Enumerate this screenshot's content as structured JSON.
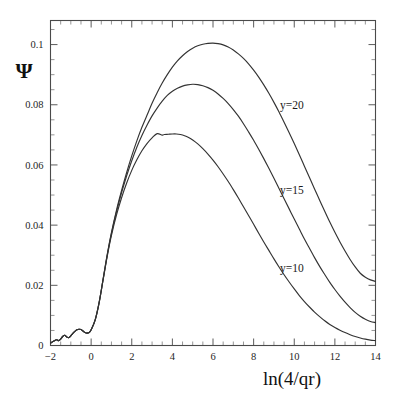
{
  "figure": {
    "background_color": "#ffffff",
    "line_color": "#333333",
    "axis_color": "#4a4a4a"
  },
  "chart_data": {
    "type": "line",
    "title": "",
    "subtitle": "",
    "xlabel": "ln(4/qr)",
    "ylabel": "Ψ",
    "xlim": [
      -2,
      14
    ],
    "ylim": [
      0,
      0.108
    ],
    "grid": false,
    "legend_position": "inline-annotations",
    "x_ticks": [
      -2,
      0,
      2,
      4,
      6,
      8,
      10,
      12,
      14
    ],
    "x_tick_labels": [
      "−2",
      "0",
      "2",
      "4",
      "6",
      "8",
      "10",
      "12",
      "14"
    ],
    "x_minor_tick_step": 0.5,
    "y_ticks": [
      0,
      0.02,
      0.04,
      0.06,
      0.08,
      0.1
    ],
    "y_tick_labels": [
      "0",
      "0.02",
      "0.04",
      "0.06",
      "0.08",
      "0.1"
    ],
    "y_minor_tick_step": 0.005,
    "annotations": [
      {
        "text": "y=20",
        "x": 9.3,
        "y": 0.0785
      },
      {
        "text": "y=15",
        "x": 9.3,
        "y": 0.0505
      },
      {
        "text": "y=10",
        "x": 9.3,
        "y": 0.0245
      }
    ],
    "series": [
      {
        "name": "y=20",
        "label": "y=20",
        "peak_x": 6.0,
        "peak_y": 0.1005,
        "points": [
          [
            -2.0,
            0.0008
          ],
          [
            -1.85,
            0.0014
          ],
          [
            -1.7,
            0.0019
          ],
          [
            -1.6,
            0.0016
          ],
          [
            -1.5,
            0.0021
          ],
          [
            -1.4,
            0.003
          ],
          [
            -1.3,
            0.0034
          ],
          [
            -1.2,
            0.0028
          ],
          [
            -1.1,
            0.0026
          ],
          [
            -1.0,
            0.0032
          ],
          [
            -0.9,
            0.004
          ],
          [
            -0.8,
            0.0047
          ],
          [
            -0.7,
            0.0052
          ],
          [
            -0.6,
            0.0054
          ],
          [
            -0.5,
            0.0053
          ],
          [
            -0.4,
            0.0048
          ],
          [
            -0.3,
            0.0043
          ],
          [
            -0.2,
            0.0041
          ],
          [
            -0.1,
            0.0043
          ],
          [
            0.0,
            0.0052
          ],
          [
            0.2,
            0.0085
          ],
          [
            0.4,
            0.0145
          ],
          [
            0.6,
            0.0225
          ],
          [
            0.8,
            0.0305
          ],
          [
            1.0,
            0.0375
          ],
          [
            1.25,
            0.045
          ],
          [
            1.5,
            0.0515
          ],
          [
            1.75,
            0.0575
          ],
          [
            2.0,
            0.063
          ],
          [
            2.25,
            0.068
          ],
          [
            2.5,
            0.0725
          ],
          [
            2.75,
            0.0765
          ],
          [
            3.0,
            0.0805
          ],
          [
            3.25,
            0.084
          ],
          [
            3.5,
            0.0872
          ],
          [
            3.75,
            0.09
          ],
          [
            4.0,
            0.0925
          ],
          [
            4.25,
            0.0946
          ],
          [
            4.5,
            0.0963
          ],
          [
            4.75,
            0.0977
          ],
          [
            5.0,
            0.0988
          ],
          [
            5.25,
            0.0996
          ],
          [
            5.5,
            0.1001
          ],
          [
            5.75,
            0.1004
          ],
          [
            6.0,
            0.1005
          ],
          [
            6.25,
            0.1003
          ],
          [
            6.5,
            0.0999
          ],
          [
            6.75,
            0.0992
          ],
          [
            7.0,
            0.0982
          ],
          [
            7.25,
            0.0969
          ],
          [
            7.5,
            0.0954
          ],
          [
            7.75,
            0.0936
          ],
          [
            8.0,
            0.0915
          ],
          [
            8.25,
            0.0892
          ],
          [
            8.5,
            0.0866
          ],
          [
            8.75,
            0.0838
          ],
          [
            9.0,
            0.0808
          ],
          [
            9.25,
            0.0776
          ],
          [
            9.5,
            0.0742
          ],
          [
            9.75,
            0.0707
          ],
          [
            10.0,
            0.0671
          ],
          [
            10.25,
            0.0634
          ],
          [
            10.5,
            0.0596
          ],
          [
            10.75,
            0.0558
          ],
          [
            11.0,
            0.052
          ],
          [
            11.25,
            0.0483
          ],
          [
            11.5,
            0.0446
          ],
          [
            11.75,
            0.041
          ],
          [
            12.0,
            0.0376
          ],
          [
            12.25,
            0.0344
          ],
          [
            12.5,
            0.0314
          ],
          [
            12.75,
            0.0286
          ],
          [
            13.0,
            0.0261
          ],
          [
            13.25,
            0.024
          ],
          [
            13.5,
            0.0227
          ],
          [
            13.75,
            0.0218
          ],
          [
            14.0,
            0.0213
          ]
        ]
      },
      {
        "name": "y=15",
        "label": "y=15",
        "peak_x": 5.1,
        "peak_y": 0.0868,
        "points": [
          [
            -2.0,
            0.0008
          ],
          [
            -1.85,
            0.0014
          ],
          [
            -1.7,
            0.0019
          ],
          [
            -1.6,
            0.0016
          ],
          [
            -1.5,
            0.0021
          ],
          [
            -1.4,
            0.003
          ],
          [
            -1.3,
            0.0034
          ],
          [
            -1.2,
            0.0028
          ],
          [
            -1.1,
            0.0026
          ],
          [
            -1.0,
            0.0032
          ],
          [
            -0.9,
            0.004
          ],
          [
            -0.8,
            0.0047
          ],
          [
            -0.7,
            0.0052
          ],
          [
            -0.6,
            0.0054
          ],
          [
            -0.5,
            0.0053
          ],
          [
            -0.4,
            0.0048
          ],
          [
            -0.3,
            0.0043
          ],
          [
            -0.2,
            0.0041
          ],
          [
            -0.1,
            0.0043
          ],
          [
            0.0,
            0.0052
          ],
          [
            0.2,
            0.0085
          ],
          [
            0.4,
            0.0145
          ],
          [
            0.6,
            0.0224
          ],
          [
            0.8,
            0.0303
          ],
          [
            1.0,
            0.0372
          ],
          [
            1.25,
            0.0445
          ],
          [
            1.5,
            0.0508
          ],
          [
            1.75,
            0.0564
          ],
          [
            2.0,
            0.0614
          ],
          [
            2.25,
            0.0659
          ],
          [
            2.5,
            0.0698
          ],
          [
            2.75,
            0.0732
          ],
          [
            3.0,
            0.0763
          ],
          [
            3.25,
            0.0789
          ],
          [
            3.5,
            0.0812
          ],
          [
            3.75,
            0.0831
          ],
          [
            4.0,
            0.0845
          ],
          [
            4.25,
            0.0855
          ],
          [
            4.5,
            0.0862
          ],
          [
            4.75,
            0.0866
          ],
          [
            5.0,
            0.0868
          ],
          [
            5.25,
            0.0867
          ],
          [
            5.5,
            0.0863
          ],
          [
            5.75,
            0.0857
          ],
          [
            6.0,
            0.0848
          ],
          [
            6.25,
            0.0836
          ],
          [
            6.5,
            0.0821
          ],
          [
            6.75,
            0.0804
          ],
          [
            7.0,
            0.0784
          ],
          [
            7.25,
            0.0762
          ],
          [
            7.5,
            0.0737
          ],
          [
            7.75,
            0.071
          ],
          [
            8.0,
            0.0682
          ],
          [
            8.25,
            0.0652
          ],
          [
            8.5,
            0.0621
          ],
          [
            8.75,
            0.0589
          ],
          [
            9.0,
            0.0556
          ],
          [
            9.25,
            0.0522
          ],
          [
            9.5,
            0.0488
          ],
          [
            9.75,
            0.0454
          ],
          [
            10.0,
            0.042
          ],
          [
            10.25,
            0.0387
          ],
          [
            10.5,
            0.0354
          ],
          [
            10.75,
            0.0323
          ],
          [
            11.0,
            0.0292
          ],
          [
            11.25,
            0.0263
          ],
          [
            11.5,
            0.0236
          ],
          [
            11.75,
            0.021
          ],
          [
            12.0,
            0.0186
          ],
          [
            12.25,
            0.0164
          ],
          [
            12.5,
            0.0144
          ],
          [
            12.75,
            0.0126
          ],
          [
            13.0,
            0.011
          ],
          [
            13.25,
            0.0097
          ],
          [
            13.5,
            0.0087
          ],
          [
            13.75,
            0.008
          ],
          [
            14.0,
            0.0076
          ]
        ]
      },
      {
        "name": "y=10",
        "label": "y=10",
        "peak_x": 4.2,
        "peak_y": 0.0703,
        "points": [
          [
            -2.0,
            0.0008
          ],
          [
            -1.85,
            0.0014
          ],
          [
            -1.7,
            0.0019
          ],
          [
            -1.6,
            0.0016
          ],
          [
            -1.5,
            0.0021
          ],
          [
            -1.4,
            0.003
          ],
          [
            -1.3,
            0.0034
          ],
          [
            -1.2,
            0.0028
          ],
          [
            -1.1,
            0.0026
          ],
          [
            -1.0,
            0.0032
          ],
          [
            -0.9,
            0.004
          ],
          [
            -0.8,
            0.0047
          ],
          [
            -0.7,
            0.0052
          ],
          [
            -0.6,
            0.0054
          ],
          [
            -0.5,
            0.0053
          ],
          [
            -0.4,
            0.0048
          ],
          [
            -0.3,
            0.0043
          ],
          [
            -0.2,
            0.0041
          ],
          [
            -0.1,
            0.0043
          ],
          [
            0.0,
            0.0052
          ],
          [
            0.2,
            0.0085
          ],
          [
            0.4,
            0.0144
          ],
          [
            0.6,
            0.0222
          ],
          [
            0.8,
            0.0299
          ],
          [
            1.0,
            0.0366
          ],
          [
            1.25,
            0.0434
          ],
          [
            1.5,
            0.0491
          ],
          [
            1.75,
            0.054
          ],
          [
            2.0,
            0.0582
          ],
          [
            2.25,
            0.0617
          ],
          [
            2.5,
            0.0647
          ],
          [
            2.75,
            0.0671
          ],
          [
            3.0,
            0.069
          ],
          [
            3.25,
            0.0704
          ],
          [
            3.5,
            0.0699
          ],
          [
            3.6,
            0.0701
          ],
          [
            3.8,
            0.0702
          ],
          [
            4.0,
            0.0703
          ],
          [
            4.2,
            0.0703
          ],
          [
            4.4,
            0.0701
          ],
          [
            4.6,
            0.0697
          ],
          [
            4.8,
            0.0691
          ],
          [
            5.0,
            0.0683
          ],
          [
            5.25,
            0.067
          ],
          [
            5.5,
            0.0654
          ],
          [
            5.75,
            0.0636
          ],
          [
            6.0,
            0.0616
          ],
          [
            6.25,
            0.0594
          ],
          [
            6.5,
            0.057
          ],
          [
            6.75,
            0.0545
          ],
          [
            7.0,
            0.0518
          ],
          [
            7.25,
            0.049
          ],
          [
            7.5,
            0.0461
          ],
          [
            7.75,
            0.0432
          ],
          [
            8.0,
            0.0403
          ],
          [
            8.25,
            0.0373
          ],
          [
            8.5,
            0.0344
          ],
          [
            8.75,
            0.0316
          ],
          [
            9.0,
            0.0288
          ],
          [
            9.25,
            0.0261
          ],
          [
            9.5,
            0.0235
          ],
          [
            9.75,
            0.0211
          ],
          [
            10.0,
            0.0188
          ],
          [
            10.25,
            0.0166
          ],
          [
            10.5,
            0.0146
          ],
          [
            10.75,
            0.0128
          ],
          [
            11.0,
            0.0111
          ],
          [
            11.25,
            0.0096
          ],
          [
            11.5,
            0.0082
          ],
          [
            11.75,
            0.007
          ],
          [
            12.0,
            0.006
          ],
          [
            12.25,
            0.0051
          ],
          [
            12.5,
            0.0043
          ],
          [
            12.75,
            0.0036
          ],
          [
            13.0,
            0.003
          ],
          [
            13.25,
            0.0025
          ],
          [
            13.5,
            0.0021
          ],
          [
            13.75,
            0.0018
          ],
          [
            14.0,
            0.0016
          ]
        ]
      }
    ]
  }
}
